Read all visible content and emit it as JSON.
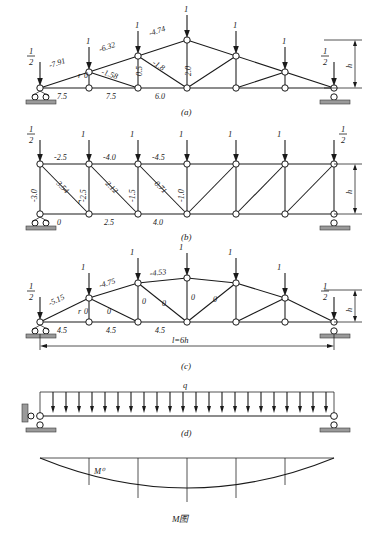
{
  "figure": {
    "title_caption": "M图",
    "panels": [
      {
        "id": "a",
        "caption": "(a)",
        "type": "triangular-truss",
        "height_label": "h",
        "loads": [
          {
            "label": "1",
            "kind": "half",
            "num": "1",
            "den": "2"
          },
          {
            "label": "1",
            "kind": "unit"
          },
          {
            "label": "1",
            "kind": "unit"
          },
          {
            "label": "1",
            "kind": "unit"
          },
          {
            "label": "1",
            "kind": "unit"
          },
          {
            "label": "1",
            "kind": "unit"
          },
          {
            "label": "1",
            "kind": "half",
            "num": "1",
            "den": "2"
          }
        ],
        "member_labels": [
          {
            "text": "-7.91"
          },
          {
            "text": "-6.32"
          },
          {
            "text": "-4.74"
          },
          {
            "text": "-1.58"
          },
          {
            "text": "-1.8"
          },
          {
            "text": "0.5"
          },
          {
            "text": "2.0"
          },
          {
            "text": "r"
          },
          {
            "text": "0"
          },
          {
            "text": "7.5"
          },
          {
            "text": "7.5"
          },
          {
            "text": "6.0"
          }
        ]
      },
      {
        "id": "b",
        "caption": "(b)",
        "type": "parallel-chord-truss",
        "height_label": "h",
        "loads": [
          {
            "label": "1",
            "kind": "half",
            "num": "1",
            "den": "2"
          },
          {
            "label": "1",
            "kind": "unit"
          },
          {
            "label": "1",
            "kind": "unit"
          },
          {
            "label": "1",
            "kind": "unit"
          },
          {
            "label": "1",
            "kind": "unit"
          },
          {
            "label": "1",
            "kind": "unit"
          },
          {
            "label": "1",
            "kind": "half",
            "num": "1",
            "den": "2"
          }
        ],
        "member_labels": [
          {
            "text": "-2.5"
          },
          {
            "text": "-4.0"
          },
          {
            "text": "-4.5"
          },
          {
            "text": "-3.0"
          },
          {
            "text": "3.54"
          },
          {
            "text": "-2.5"
          },
          {
            "text": "2.12"
          },
          {
            "text": "-1.5"
          },
          {
            "text": "0.71"
          },
          {
            "text": "-1.0"
          },
          {
            "text": "r"
          },
          {
            "text": "0"
          },
          {
            "text": "2.5"
          },
          {
            "text": "4.0"
          }
        ]
      },
      {
        "id": "c",
        "caption": "(c)",
        "type": "parabolic-truss",
        "height_label": "h",
        "span_label": "l=6h",
        "loads": [
          {
            "label": "1",
            "kind": "half",
            "num": "1",
            "den": "2"
          },
          {
            "label": "1",
            "kind": "unit"
          },
          {
            "label": "1",
            "kind": "unit"
          },
          {
            "label": "1",
            "kind": "unit"
          },
          {
            "label": "1",
            "kind": "unit"
          },
          {
            "label": "1",
            "kind": "unit"
          },
          {
            "label": "1",
            "kind": "half",
            "num": "1",
            "den": "2"
          }
        ],
        "member_labels": [
          {
            "text": "-5.15"
          },
          {
            "text": "-4.75"
          },
          {
            "text": "-4.53"
          },
          {
            "text": "0"
          },
          {
            "text": "0"
          },
          {
            "text": "0"
          },
          {
            "text": "0"
          },
          {
            "text": "0"
          },
          {
            "text": "r"
          },
          {
            "text": "0"
          },
          {
            "text": "4.5"
          },
          {
            "text": "4.5"
          },
          {
            "text": "4.5"
          }
        ]
      },
      {
        "id": "d",
        "caption": "(d)",
        "type": "uniform-loaded-beam",
        "load_label": "q"
      },
      {
        "id": "m",
        "caption": "M图",
        "type": "moment-diagram",
        "peak_label": "M⁰"
      }
    ]
  }
}
